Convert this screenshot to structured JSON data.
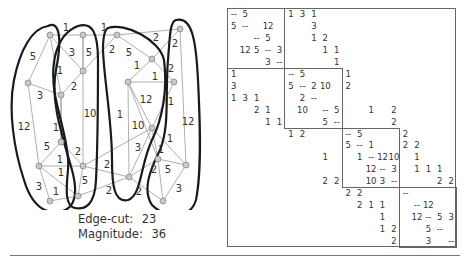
{
  "graph": {
    "nodes": [
      {
        "id": "a",
        "x": 50,
        "y": 35
      },
      {
        "id": "b",
        "x": 83,
        "y": 35
      },
      {
        "id": "c",
        "x": 117,
        "y": 35
      },
      {
        "id": "d",
        "x": 180,
        "y": 29
      },
      {
        "id": "e",
        "x": 28,
        "y": 83
      },
      {
        "id": "f",
        "x": 83,
        "y": 71
      },
      {
        "id": "g",
        "x": 152,
        "y": 59
      },
      {
        "id": "h",
        "x": 128,
        "y": 82
      },
      {
        "id": "i",
        "x": 174,
        "y": 82
      },
      {
        "id": "j",
        "x": 61,
        "y": 95
      },
      {
        "id": "k",
        "x": 152,
        "y": 128
      },
      {
        "id": "l",
        "x": 61,
        "y": 142
      },
      {
        "id": "m",
        "x": 158,
        "y": 159
      },
      {
        "id": "n",
        "x": 39,
        "y": 166
      },
      {
        "id": "o",
        "x": 83,
        "y": 166
      },
      {
        "id": "p",
        "x": 186,
        "y": 165
      },
      {
        "id": "q",
        "x": 129,
        "y": 177
      },
      {
        "id": "r",
        "x": 50,
        "y": 201
      },
      {
        "id": "s",
        "x": 78,
        "y": 196
      },
      {
        "id": "t",
        "x": 163,
        "y": 201
      }
    ],
    "edges": [
      {
        "from": "a",
        "to": "b",
        "w": "1",
        "lx": 66,
        "ly": 28
      },
      {
        "from": "b",
        "to": "c",
        "w": "1",
        "lx": 104,
        "ly": 28
      },
      {
        "from": "c",
        "to": "d",
        "w": "2",
        "lx": 156,
        "ly": 38
      },
      {
        "from": "a",
        "to": "e",
        "w": "5",
        "lx": 33,
        "ly": 57
      },
      {
        "from": "a",
        "to": "j",
        "w": "1",
        "lx": 60,
        "ly": 71
      },
      {
        "from": "b",
        "to": "f",
        "w": "5",
        "lx": 89,
        "ly": 53
      },
      {
        "from": "a",
        "to": "f",
        "w": "3",
        "lx": 72,
        "ly": 53
      },
      {
        "from": "c",
        "to": "f",
        "w": "2",
        "lx": 112,
        "ly": 50
      },
      {
        "from": "c",
        "to": "g",
        "w": "5",
        "lx": 129,
        "ly": 53
      },
      {
        "from": "d",
        "to": "g",
        "w": "2",
        "lx": 175,
        "ly": 44
      },
      {
        "from": "g",
        "to": "h",
        "w": "1",
        "lx": 137,
        "ly": 66
      },
      {
        "from": "g",
        "to": "i",
        "w": "2",
        "lx": 171,
        "ly": 69
      },
      {
        "from": "h",
        "to": "i",
        "w": "1",
        "lx": 155,
        "ly": 77
      },
      {
        "from": "e",
        "to": "j",
        "w": "3",
        "lx": 40,
        "ly": 96
      },
      {
        "from": "f",
        "to": "j",
        "w": "2",
        "lx": 74,
        "ly": 87
      },
      {
        "from": "b",
        "to": "o",
        "w": "10",
        "lx": 90,
        "ly": 114
      },
      {
        "from": "h",
        "to": "k",
        "w": "12",
        "lx": 146,
        "ly": 100
      },
      {
        "from": "i",
        "to": "k",
        "w": "1",
        "lx": 171,
        "ly": 102
      },
      {
        "from": "h",
        "to": "q",
        "w": "1",
        "lx": 120,
        "ly": 115
      },
      {
        "from": "h",
        "to": "m",
        "w": "10",
        "lx": 138,
        "ly": 126
      },
      {
        "from": "d",
        "to": "p",
        "w": "12",
        "lx": 188,
        "ly": 122
      },
      {
        "from": "e",
        "to": "n",
        "w": "12",
        "lx": 24,
        "ly": 127
      },
      {
        "from": "j",
        "to": "l",
        "w": "1",
        "lx": 56,
        "ly": 128
      },
      {
        "from": "l",
        "to": "n",
        "w": "5",
        "lx": 47,
        "ly": 147
      },
      {
        "from": "l",
        "to": "o",
        "w": "2",
        "lx": 78,
        "ly": 152
      },
      {
        "from": "n",
        "to": "o",
        "w": "1",
        "lx": 60,
        "ly": 160
      },
      {
        "from": "n",
        "to": "s",
        "w": "1",
        "lx": 61,
        "ly": 173
      },
      {
        "from": "o",
        "to": "s",
        "w": "5",
        "lx": 85,
        "ly": 181
      },
      {
        "from": "n",
        "to": "r",
        "w": "3",
        "lx": 39,
        "ly": 187
      },
      {
        "from": "r",
        "to": "s",
        "w": "1",
        "lx": 56,
        "ly": 192
      },
      {
        "from": "o",
        "to": "q",
        "w": "2",
        "lx": 107,
        "ly": 165
      },
      {
        "from": "s",
        "to": "q",
        "w": "2",
        "lx": 109,
        "ly": 191
      },
      {
        "from": "k",
        "to": "q",
        "w": "3",
        "lx": 138,
        "ly": 148
      },
      {
        "from": "k",
        "to": "p",
        "w": "1",
        "lx": 170,
        "ly": 139
      },
      {
        "from": "k",
        "to": "m",
        "w": "1",
        "lx": 161,
        "ly": 150
      },
      {
        "from": "m",
        "to": "p",
        "w": "5",
        "lx": 168,
        "ly": 170
      },
      {
        "from": "q",
        "to": "m",
        "w": "2",
        "lx": 154,
        "ly": 170
      },
      {
        "from": "q",
        "to": "t",
        "w": "2",
        "lx": 139,
        "ly": 192
      },
      {
        "from": "p",
        "to": "t",
        "w": "3",
        "lx": 179,
        "ly": 189
      },
      {
        "from": "o",
        "to": "k",
        "w": "",
        "lx": 0,
        "ly": 0
      },
      {
        "from": "l",
        "to": "j",
        "w": "",
        "lx": 0,
        "ly": 0
      },
      {
        "from": "t",
        "to": "m",
        "w": "",
        "lx": 0,
        "ly": 0
      },
      {
        "from": "h",
        "to": "i2",
        "w": "",
        "lx": 0,
        "ly": 0
      }
    ],
    "partitions": [
      "M 48 26 C 60 20, 62 40, 56 70 C 50 100, 62 135, 72 170 C 80 200, 72 212, 55 212 C 40 212, 30 200, 24 180 C 14 150, 8 110, 14 80 C 20 50, 32 28, 48 26 Z",
      "M 78 26 C 92 22, 98 32, 98 60 C 98 100, 98 140, 96 180 C 95 205, 85 210, 75 208 C 65 206, 66 190, 68 170 C 70 150, 60 120, 55 95 C 50 65, 55 35, 78 26 Z",
      "M 108 28 C 125 22, 160 40, 164 60 C 168 90, 162 120, 152 140 C 140 165, 142 195, 128 200 C 114 203, 112 185, 112 160 C 112 120, 104 80, 103 50 C 103 38, 104 30, 108 28 Z",
      "M 176 20 C 192 16, 196 40, 198 80 C 200 120, 202 170, 196 200 C 190 220, 165 218, 152 205 C 142 190, 150 170, 160 150 C 170 125, 165 95, 168 60 C 170 35, 170 22, 176 20 Z"
    ]
  },
  "stats": {
    "edge_cut_label": "Edge-cut:",
    "edge_cut_value": "23",
    "magnitude_label": "Magnitude:",
    "magnitude_value": "36"
  },
  "matrix": {
    "size": 20,
    "block_size": 5,
    "entries": [
      [
        0,
        0,
        "--"
      ],
      [
        0,
        1,
        "5"
      ],
      [
        0,
        5,
        "1"
      ],
      [
        0,
        6,
        "3"
      ],
      [
        0,
        7,
        "1"
      ],
      [
        1,
        0,
        "5"
      ],
      [
        1,
        1,
        "--"
      ],
      [
        1,
        3,
        "12"
      ],
      [
        1,
        7,
        "3"
      ],
      [
        2,
        2,
        "--"
      ],
      [
        2,
        3,
        "5"
      ],
      [
        2,
        7,
        "1"
      ],
      [
        2,
        8,
        "2"
      ],
      [
        3,
        1,
        "12"
      ],
      [
        3,
        2,
        "5"
      ],
      [
        3,
        3,
        "--"
      ],
      [
        3,
        4,
        "3"
      ],
      [
        3,
        8,
        "1"
      ],
      [
        3,
        9,
        "1"
      ],
      [
        4,
        3,
        "3"
      ],
      [
        4,
        4,
        "--"
      ],
      [
        4,
        9,
        "1"
      ],
      [
        5,
        0,
        "1"
      ],
      [
        5,
        5,
        "--"
      ],
      [
        5,
        6,
        "5"
      ],
      [
        5,
        10,
        "1"
      ],
      [
        6,
        0,
        "3"
      ],
      [
        6,
        5,
        "5"
      ],
      [
        6,
        6,
        "--"
      ],
      [
        6,
        7,
        "2"
      ],
      [
        6,
        8,
        "10"
      ],
      [
        6,
        10,
        "2"
      ],
      [
        7,
        0,
        "1"
      ],
      [
        7,
        1,
        "3"
      ],
      [
        7,
        2,
        "1"
      ],
      [
        7,
        6,
        "2"
      ],
      [
        7,
        7,
        "--"
      ],
      [
        8,
        2,
        "2"
      ],
      [
        8,
        3,
        "1"
      ],
      [
        8,
        6,
        "10"
      ],
      [
        8,
        8,
        "--"
      ],
      [
        8,
        9,
        "5"
      ],
      [
        8,
        12,
        "1"
      ],
      [
        8,
        14,
        "2"
      ],
      [
        9,
        3,
        "1"
      ],
      [
        9,
        4,
        "1"
      ],
      [
        9,
        8,
        "5"
      ],
      [
        9,
        9,
        "--"
      ],
      [
        9,
        14,
        "2"
      ],
      [
        10,
        5,
        "1"
      ],
      [
        10,
        6,
        "2"
      ],
      [
        10,
        10,
        "--"
      ],
      [
        10,
        11,
        "5"
      ],
      [
        10,
        15,
        "2"
      ],
      [
        11,
        10,
        "5"
      ],
      [
        11,
        11,
        "--"
      ],
      [
        11,
        12,
        "1"
      ],
      [
        11,
        15,
        "2"
      ],
      [
        11,
        16,
        "2"
      ],
      [
        12,
        8,
        "1"
      ],
      [
        12,
        11,
        "1"
      ],
      [
        12,
        12,
        "--"
      ],
      [
        12,
        13,
        "12"
      ],
      [
        12,
        14,
        "10"
      ],
      [
        12,
        16,
        "1"
      ],
      [
        13,
        12,
        "12"
      ],
      [
        13,
        13,
        "--"
      ],
      [
        13,
        14,
        "3"
      ],
      [
        13,
        16,
        "1"
      ],
      [
        13,
        17,
        "1"
      ],
      [
        13,
        18,
        "1"
      ],
      [
        14,
        8,
        "2"
      ],
      [
        14,
        9,
        "2"
      ],
      [
        14,
        12,
        "10"
      ],
      [
        14,
        13,
        "3"
      ],
      [
        14,
        14,
        "--"
      ],
      [
        14,
        18,
        "2"
      ],
      [
        14,
        19,
        "2"
      ],
      [
        15,
        10,
        "2"
      ],
      [
        15,
        11,
        "2"
      ],
      [
        15,
        15,
        "--"
      ],
      [
        16,
        11,
        "2"
      ],
      [
        16,
        12,
        "1"
      ],
      [
        16,
        13,
        "1"
      ],
      [
        16,
        16,
        "--"
      ],
      [
        16,
        17,
        "12"
      ],
      [
        17,
        13,
        "1"
      ],
      [
        17,
        16,
        "12"
      ],
      [
        17,
        17,
        "--"
      ],
      [
        17,
        18,
        "5"
      ],
      [
        17,
        19,
        "3"
      ],
      [
        18,
        13,
        "1"
      ],
      [
        18,
        14,
        "2"
      ],
      [
        18,
        17,
        "5"
      ],
      [
        18,
        18,
        "--"
      ],
      [
        19,
        14,
        "2"
      ],
      [
        19,
        17,
        "3"
      ],
      [
        19,
        19,
        "--"
      ]
    ]
  },
  "colors": {
    "node_fill": "#c8c8c8",
    "node_stroke": "#888888",
    "edge": "#9a9a9a",
    "partition": "#1a1a1a",
    "text": "#333333",
    "frame": "#666666"
  }
}
